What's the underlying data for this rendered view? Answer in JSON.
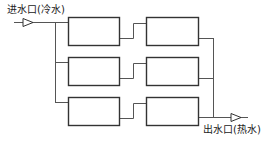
{
  "diagram": {
    "title": "",
    "inlet": {
      "label": "进水口(冷水)",
      "arrow": "triangle-arrow-icon"
    },
    "outlet": {
      "label": "出水口(热水)",
      "arrow": "triangle-arrow-icon"
    },
    "rows": [
      {
        "left_box": "",
        "right_box": ""
      },
      {
        "left_box": "",
        "right_box": ""
      },
      {
        "left_box": "",
        "right_box": ""
      }
    ],
    "structure": "3 parallel branches, each with 2 units in series; cold water inlet manifold on left, hot water outlet manifold on right",
    "colors": {
      "line": "#555555",
      "box_border": "#333333",
      "background": "#ffffff"
    }
  }
}
